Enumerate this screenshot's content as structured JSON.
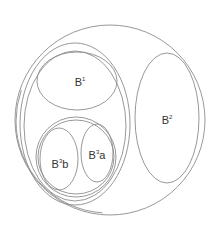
{
  "diagram": {
    "type": "nested-sets",
    "stroke_color": "#8c8c8c",
    "text_color": "#333333",
    "sets": [
      {
        "id": "outer",
        "label": ""
      },
      {
        "id": "B1",
        "label_base": "B",
        "label_sup": "1",
        "label_suffix": ""
      },
      {
        "id": "B2",
        "label_base": "B",
        "label_sup": "2",
        "label_suffix": ""
      },
      {
        "id": "B3a",
        "label_base": "B",
        "label_sup": "3",
        "label_suffix": "a"
      },
      {
        "id": "B3b",
        "label_base": "B",
        "label_sup": "3",
        "label_suffix": "b"
      }
    ]
  }
}
